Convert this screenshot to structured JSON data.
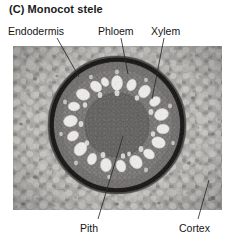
{
  "figure": {
    "panel_letter": "(C)",
    "title": "Monocot stele",
    "image_type": "light micrograph"
  },
  "labels": [
    {
      "id": "endodermis",
      "text": "Endodermis",
      "position": "top-left",
      "leader": {
        "x1": 57,
        "y1": 38,
        "x2": 79,
        "y2": 77
      }
    },
    {
      "id": "phloem",
      "text": "Phloem",
      "position": "top-center",
      "leader": {
        "x1": 121,
        "y1": 38,
        "x2": 128,
        "y2": 74
      }
    },
    {
      "id": "xylem",
      "text": "Xylem",
      "position": "top-right",
      "leader": {
        "x1": 164,
        "y1": 38,
        "x2": 152,
        "y2": 99
      }
    },
    {
      "id": "pith",
      "text": "Pith",
      "position": "bottom-center",
      "leader": {
        "x1": 123,
        "y1": 136,
        "x2": 98,
        "y2": 219
      }
    },
    {
      "id": "cortex",
      "text": "Cortex",
      "position": "bottom-right",
      "leader": {
        "x1": 209,
        "y1": 180,
        "x2": 198,
        "y2": 219
      }
    }
  ],
  "micrograph": {
    "regions": [
      {
        "name": "cortex",
        "description": "outer light gray parenchyma with large rounded cells"
      },
      {
        "name": "endodermis",
        "description": "dark near-black ring bounding the stele"
      },
      {
        "name": "pericycle",
        "description": "narrow layer inside endodermis"
      },
      {
        "name": "phloem",
        "description": "tissue between xylem vessels"
      },
      {
        "name": "xylem",
        "description": "ring of large white vessel lumens"
      },
      {
        "name": "pith",
        "description": "dark central ground tissue"
      }
    ],
    "colors": {
      "cortex": "#b3b1ad",
      "endodermis": "#201e1d",
      "stele": "#6f6d6b",
      "pith": "#575554",
      "vessel_lumen": "#f2f1ee",
      "background": "#9d9b98"
    },
    "vessel_count": 18
  }
}
